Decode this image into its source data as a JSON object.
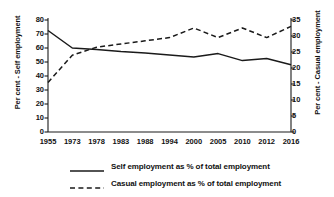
{
  "chart_data": {
    "type": "line",
    "title": "",
    "xlabel": "",
    "ylabel": "Per cent - Self employment",
    "y2label": "Per cent - Casual employment",
    "categories": [
      "1955",
      "1973",
      "1978",
      "1983",
      "1988",
      "1994",
      "2000",
      "2005",
      "2010",
      "2012",
      "2016"
    ],
    "ylim": [
      0,
      80
    ],
    "yticks": [
      0,
      10,
      20,
      30,
      40,
      50,
      60,
      70,
      80
    ],
    "y2lim": [
      0,
      35
    ],
    "y2ticks": [
      0,
      5,
      10,
      15,
      20,
      25,
      30,
      35
    ],
    "grid": false,
    "legend_position": "bottom",
    "series": [
      {
        "name": "Self employment as % of total employment",
        "axis": "left",
        "style": "solid",
        "color": "#1a1a1a",
        "values": [
          72.5,
          60.0,
          59.0,
          57.5,
          56.5,
          55.0,
          53.5,
          56.0,
          51.0,
          52.5,
          48.0
        ]
      },
      {
        "name": "Casual employment as % of total employment",
        "axis": "right",
        "style": "dashed",
        "color": "#1a1a1a",
        "values": [
          15.5,
          24.0,
          26.5,
          27.5,
          28.5,
          29.5,
          32.5,
          29.5,
          32.5,
          29.5,
          33.0
        ]
      }
    ]
  },
  "axes": {
    "left_title": "Per cent - Self employment",
    "right_title": "Per cent - Casual employment",
    "left_ticks": [
      "80",
      "70",
      "60",
      "50",
      "40",
      "30",
      "20",
      "10",
      "0"
    ],
    "right_ticks": [
      "35",
      "30",
      "25",
      "20",
      "15",
      "10",
      "5",
      "0"
    ],
    "x_ticks": [
      "1955",
      "1973",
      "1978",
      "1983",
      "1988",
      "1994",
      "2000",
      "2005",
      "2010",
      "2012",
      "2016"
    ]
  },
  "legend": {
    "items": [
      {
        "label": "Self employment as % of total employment",
        "style": "solid"
      },
      {
        "label": "Casual employment as % of total employment",
        "style": "dashed"
      }
    ]
  },
  "colors": {
    "line": "#1a1a1a",
    "axis": "#1a1a1a",
    "background": "#ffffff"
  }
}
